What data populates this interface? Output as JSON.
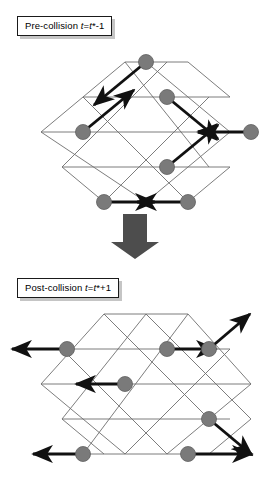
{
  "figure": {
    "type": "lattice-gas-collision-diagram",
    "background_color": "#ffffff",
    "node_color": "#7a7a7a",
    "node_stroke_color": "#5a5a5a",
    "lattice_line_color": "#6e6e6e",
    "arrow_color": "#111111",
    "block_arrow_color": "#4d4d4d",
    "label_border_color": "#1a1a1a",
    "label_shadow_color": "#969696"
  },
  "panels": [
    {
      "id": "pre-collision",
      "label": {
        "prefix": "Pre-collision ",
        "var1": "t",
        "eq": "=",
        "var2": "t",
        "suffix": "*-1",
        "full_text": "Pre-collision t=t*-1"
      },
      "lattice": {
        "shape": "hexagon",
        "rows": 5,
        "columns": 5,
        "cell_width": 42,
        "row_height": 35
      },
      "particles": [
        {
          "id": "p1",
          "node": "top-center",
          "cx": 146,
          "cy": 10,
          "velocity_direction": "down-left",
          "label": "node-top-center"
        },
        {
          "id": "p2",
          "node": "mid-upper-right",
          "cx": 167,
          "cy": 45,
          "velocity_direction": "down-right",
          "label": "node-mid-upper-right"
        },
        {
          "id": "p3",
          "node": "mid-left",
          "cx": 83,
          "cy": 80,
          "velocity_direction": "up-right",
          "label": "node-mid-left"
        },
        {
          "id": "p4",
          "node": "right-outer",
          "cx": 251,
          "cy": 80,
          "velocity_direction": "left",
          "label": "node-right-outer"
        },
        {
          "id": "p5",
          "node": "mid-lower-right",
          "cx": 167,
          "cy": 115,
          "velocity_direction": "up-right",
          "label": "node-mid-lower-right"
        },
        {
          "id": "p6",
          "node": "bottom-left",
          "cx": 104,
          "cy": 150,
          "velocity_direction": "right",
          "label": "node-bottom-left"
        },
        {
          "id": "p7",
          "node": "bottom-right",
          "cx": 188,
          "cy": 150,
          "velocity_direction": "left",
          "label": "node-bottom-right"
        }
      ]
    },
    {
      "id": "post-collision",
      "label": {
        "prefix": "Post-collision ",
        "var1": "t",
        "eq": "=",
        "var2": "t",
        "suffix": "*+1",
        "full_text": "Post-collision t=t*+1"
      },
      "lattice": {
        "shape": "hexagon",
        "rows": 5,
        "columns": 5,
        "cell_width": 42,
        "row_height": 35
      },
      "particles": [
        {
          "id": "q1",
          "node": "upper-left",
          "cx": 67,
          "cy": 45,
          "velocity_direction": "left",
          "label": "node-upper-left"
        },
        {
          "id": "q2",
          "node": "upper-mid-right",
          "cx": 167,
          "cy": 45,
          "velocity_direction": "right",
          "label": "node-upper-mid-right"
        },
        {
          "id": "q3",
          "node": "upper-right",
          "cx": 209,
          "cy": 45,
          "velocity_direction": "up-right",
          "label": "node-upper-right"
        },
        {
          "id": "q4",
          "node": "center",
          "cx": 125,
          "cy": 80,
          "velocity_direction": "left",
          "label": "node-center"
        },
        {
          "id": "q5",
          "node": "lower-right",
          "cx": 209,
          "cy": 115,
          "velocity_direction": "down-right",
          "label": "node-lower-right"
        },
        {
          "id": "q6",
          "node": "bottom-left",
          "cx": 83,
          "cy": 150,
          "velocity_direction": "left",
          "label": "node-bottom-left"
        },
        {
          "id": "q7",
          "node": "bottom-right",
          "cx": 188,
          "cy": 150,
          "velocity_direction": "right",
          "label": "node-bottom-right"
        }
      ]
    }
  ],
  "transition_arrow": {
    "direction": "down",
    "name": "block-arrow-down",
    "color": "#4d4d4d"
  }
}
